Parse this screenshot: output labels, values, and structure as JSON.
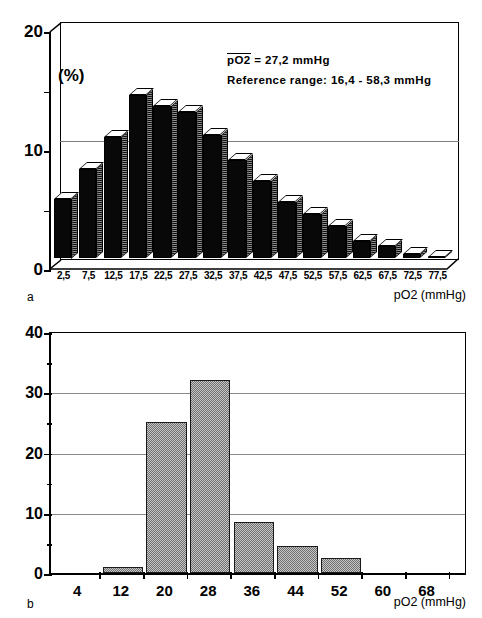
{
  "figure": {
    "panel_a_letter": "a",
    "panel_b_letter": "b"
  },
  "panel_a": {
    "letter": "a",
    "annotation_line1_label": "pO2",
    "annotation_line1_rest": " =  27,2  mmHg",
    "annotation_line2": "Reference  range:  16,4  -  58,3  mmHg",
    "mean_value": "27,2",
    "mean_unit": "mmHg",
    "reference_range_low": "16,4",
    "reference_range_high": "58,3",
    "y_unit_label": "(%)",
    "x_axis_title": "pO2 (mmHg)",
    "y_ticks": [
      "0",
      "10",
      "20"
    ]
  },
  "panel_b": {
    "letter": "b",
    "x_axis_title": "pO2 (mmHg)",
    "y_ticks": [
      "0",
      "10",
      "20",
      "30",
      "40"
    ]
  },
  "chart_data": [
    {
      "type": "bar",
      "id": "panel-a",
      "title": "",
      "subtitle": "pO2 = 27,2 mmHg; Reference range: 16,4 - 58,3 mmHg",
      "style": "3d-histogram",
      "xlabel": "pO2 (mmHg)",
      "ylabel": "(%)",
      "ylim": [
        0,
        20
      ],
      "y_major_ticks": [
        0,
        10,
        20
      ],
      "y_minor_ticks": [
        5,
        15
      ],
      "grid": true,
      "legend": "none",
      "categories": [
        "2,5",
        "7,5",
        "12,5",
        "17,5",
        "22,5",
        "27,5",
        "32,5",
        "37,5",
        "42,5",
        "47,5",
        "52,5",
        "57,5",
        "62,5",
        "67,5",
        "72,5",
        "77,5"
      ],
      "values": [
        5.0,
        7.5,
        10.2,
        13.7,
        12.8,
        12.3,
        10.3,
        8.2,
        6.5,
        4.7,
        3.7,
        2.7,
        1.4,
        1.0,
        0.3,
        0.05
      ],
      "bar_front_color": "#080808",
      "bar_top_color": "#ffffff",
      "bar_side_color": "#808080"
    },
    {
      "type": "bar",
      "id": "panel-b",
      "title": "",
      "style": "2d-histogram",
      "xlabel": "pO2 (mmHg)",
      "ylabel": "",
      "ylim": [
        0,
        40
      ],
      "y_major_ticks": [
        0,
        10,
        20,
        30,
        40
      ],
      "y_minor_ticks": [
        5,
        15,
        25,
        35
      ],
      "grid": true,
      "legend": "none",
      "categories": [
        "4",
        "12",
        "20",
        "28",
        "36",
        "44",
        "52",
        "60",
        "68"
      ],
      "values": [
        0,
        1.0,
        25.0,
        32.0,
        8.4,
        4.5,
        2.5,
        0,
        0
      ],
      "bar_fill_color": "#9a9a9a",
      "bar_edge_color": "#1a1a1a"
    }
  ]
}
